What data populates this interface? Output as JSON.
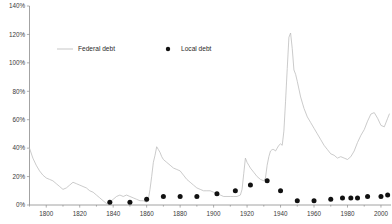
{
  "chart_data": {
    "type": "line",
    "title": "",
    "subtitle": "",
    "xlabel": "",
    "ylabel": "",
    "xlim": [
      1790,
      2006
    ],
    "ylim": [
      0,
      140
    ],
    "grid": false,
    "legend_position": "top-left",
    "x_ticks": [
      1800,
      1820,
      1840,
      1860,
      1880,
      1900,
      1920,
      1940,
      1960,
      1980,
      2000
    ],
    "x_tick_labels": [
      "1800",
      "1820",
      "1840",
      "1860",
      "1880",
      "1900",
      "1920",
      "1940",
      "1960",
      "1980",
      "2000"
    ],
    "y_ticks": [
      0,
      20,
      40,
      60,
      80,
      100,
      120,
      140
    ],
    "y_tick_labels": [
      "0%",
      "20%",
      "40%",
      "60%",
      "80%",
      "100%",
      "120%",
      "140%"
    ],
    "series": [
      {
        "name": "Federal debt",
        "type": "line",
        "color": "#b9b9b9",
        "x": [
          1790,
          1792,
          1794,
          1796,
          1798,
          1800,
          1802,
          1804,
          1806,
          1808,
          1810,
          1812,
          1814,
          1816,
          1818,
          1820,
          1822,
          1824,
          1826,
          1828,
          1830,
          1832,
          1834,
          1836,
          1838,
          1840,
          1842,
          1844,
          1846,
          1848,
          1850,
          1852,
          1854,
          1856,
          1858,
          1860,
          1861,
          1862,
          1863,
          1864,
          1865,
          1866,
          1867,
          1868,
          1869,
          1870,
          1872,
          1874,
          1876,
          1878,
          1880,
          1882,
          1884,
          1886,
          1888,
          1890,
          1892,
          1894,
          1896,
          1898,
          1900,
          1902,
          1904,
          1906,
          1908,
          1910,
          1912,
          1914,
          1916,
          1917,
          1918,
          1919,
          1920,
          1921,
          1922,
          1924,
          1926,
          1928,
          1930,
          1931,
          1932,
          1933,
          1934,
          1935,
          1936,
          1937,
          1938,
          1939,
          1940,
          1941,
          1942,
          1943,
          1944,
          1945,
          1946,
          1947,
          1948,
          1949,
          1950,
          1952,
          1954,
          1956,
          1958,
          1960,
          1962,
          1964,
          1966,
          1968,
          1970,
          1972,
          1974,
          1976,
          1978,
          1980,
          1982,
          1984,
          1986,
          1988,
          1990,
          1992,
          1994,
          1996,
          1998,
          2000,
          2002,
          2004,
          2005
        ],
        "y": [
          40,
          33,
          28,
          24,
          21,
          19,
          18,
          17,
          15,
          13,
          11,
          12,
          14,
          16,
          15,
          14,
          13,
          12,
          10,
          9,
          7,
          5,
          3,
          1,
          2,
          4,
          6,
          7,
          6,
          7,
          6,
          5,
          4,
          3,
          3,
          2,
          4,
          11,
          20,
          30,
          35,
          41,
          39,
          37,
          34,
          32,
          30,
          28,
          26,
          25,
          24,
          21,
          18,
          16,
          14,
          12,
          11,
          10,
          10,
          10,
          9,
          8,
          7,
          6,
          6,
          6,
          6,
          6,
          7,
          11,
          22,
          33,
          30,
          28,
          26,
          23,
          20,
          18,
          17,
          19,
          28,
          34,
          38,
          39,
          39,
          38,
          40,
          42,
          43,
          42,
          52,
          73,
          96,
          118,
          121,
          110,
          95,
          92,
          87,
          76,
          68,
          62,
          58,
          54,
          50,
          46,
          42,
          39,
          36,
          35,
          33,
          34,
          33,
          32,
          34,
          38,
          44,
          49,
          53,
          59,
          64,
          65,
          61,
          56,
          55,
          61,
          64
        ]
      },
      {
        "name": "Local debt",
        "type": "scatter",
        "color": "#111111",
        "x": [
          1838,
          1850,
          1860,
          1870,
          1880,
          1890,
          1902,
          1913,
          1922,
          1932,
          1940,
          1950,
          1960,
          1970,
          1977,
          1982,
          1986,
          1992,
          2000,
          2004
        ],
        "y": [
          2,
          2,
          4,
          6,
          6,
          6,
          8,
          10,
          14,
          17,
          10,
          3,
          3,
          4,
          5,
          5,
          5,
          6,
          6,
          7
        ]
      }
    ],
    "legend": [
      {
        "label": "Federal debt",
        "marker": "line",
        "color": "#b9b9b9"
      },
      {
        "label": "Local debt",
        "marker": "dot",
        "color": "#111111"
      }
    ]
  }
}
